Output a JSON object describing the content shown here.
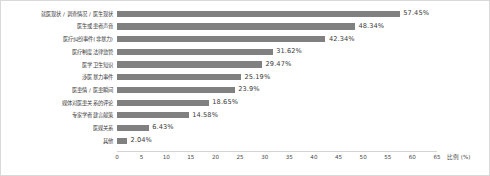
{
  "chart_data": {
    "type": "bar",
    "orientation": "horizontal",
    "title": "",
    "subtitle": "",
    "xlabel": "比例 (%)",
    "ylabel": "",
    "xlim": [
      0,
      65
    ],
    "xticks": [
      "0",
      "5",
      "10",
      "15",
      "20",
      "25",
      "30",
      "35",
      "40",
      "45",
      "50",
      "55",
      "60",
      "65"
    ],
    "xtick_values": [
      0,
      5,
      10,
      15,
      20,
      25,
      30,
      35,
      40,
      45,
      50,
      55,
      60,
      65
    ],
    "grid": false,
    "legend": false,
    "bar_color": "#808080",
    "categories": [
      "就医现状 / 调查情况 / 医生现状",
      "医生或患者声音",
      "医疗纠纷事件(非暴力)",
      "医疗制度法律监管",
      "医学卫生知识",
      "涉医暴力事件",
      "医患情 / 医患瞬间",
      "媒体对医患关系的评论",
      "专家学者建言献策",
      "医媒关系",
      "其他"
    ],
    "values": [
      57.45,
      48.34,
      42.34,
      31.62,
      29.47,
      25.19,
      23.9,
      18.65,
      14.58,
      6.43,
      2.04
    ],
    "data_labels": [
      "57.45%",
      "48.34%",
      "42.34%",
      "31.62%",
      "29.47%",
      "25.19%",
      "23.9%",
      "18.65%",
      "14.58%",
      "6.43%",
      "2.04%"
    ]
  }
}
